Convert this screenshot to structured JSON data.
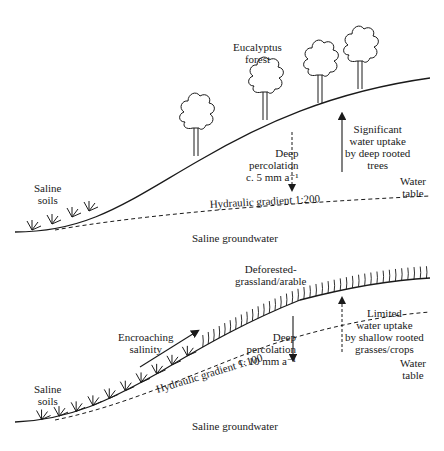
{
  "top_panel": {
    "forest_label": [
      "Eucalyptus",
      "forest"
    ],
    "saline_soils_label": [
      "Saline",
      "soils"
    ],
    "percolation_label": [
      "Deep",
      "percolation",
      "c. 5 mm a⁻¹"
    ],
    "uptake_label": [
      "Significant",
      "water uptake",
      "by deep rooted",
      "trees"
    ],
    "water_table_label": [
      "Water",
      "table"
    ],
    "gradient_label": "Hydraulic gradient 1:200",
    "groundwater_label": "Saline groundwater",
    "percolation_arrow_style": "dashed-down",
    "uptake_arrow_style": "solid-up",
    "tree_count": 5
  },
  "bottom_panel": {
    "land_use_label": [
      "Deforested-",
      "grassland/arable"
    ],
    "encroaching_label": [
      "Encroaching",
      "salinity"
    ],
    "saline_soils_label": [
      "Saline",
      "soils"
    ],
    "percolation_label": [
      "Deep",
      "percolation",
      "c. 10 mm a⁻¹"
    ],
    "uptake_label": [
      "Limited",
      "water uptake",
      "by shallow rooted",
      "grasses/crops"
    ],
    "water_table_label": [
      "Water",
      "table"
    ],
    "gradient_label": "Hydraulic gradient 1:100",
    "groundwater_label": "Saline groundwater",
    "percolation_arrow_style": "solid-down",
    "uptake_arrow_style": "dashed-up"
  },
  "colors": {
    "ink": "#1a1a1a",
    "background": "#ffffff"
  }
}
